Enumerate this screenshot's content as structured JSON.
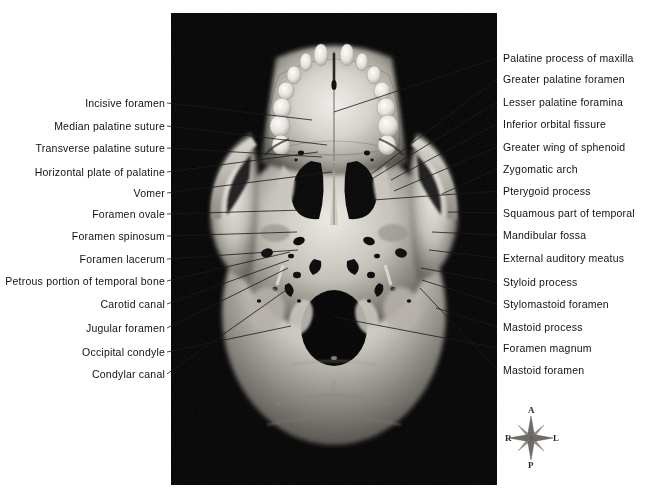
{
  "figure": {
    "photo": {
      "description": "black-and-white photograph of a human skull viewed from below",
      "frame": {
        "x": 171,
        "y": 13,
        "width": 326,
        "height": 472
      },
      "background_color": "#010101"
    },
    "page_background": "#ffffff",
    "label_color": "#111111",
    "leader_color": "#1a1a1a"
  },
  "labels_left": [
    {
      "text": "Incisive foramen",
      "x": 171,
      "y": 103,
      "tx": 312,
      "ty": 120
    },
    {
      "text": "Median palatine suture",
      "x": 171,
      "y": 126,
      "tx": 327,
      "ty": 145
    },
    {
      "text": "Transverse palatine suture",
      "x": 171,
      "y": 148,
      "tx": 322,
      "ty": 157
    },
    {
      "text": "Horizontal plate of palatine",
      "x": 171,
      "y": 172,
      "tx": 318,
      "ty": 152
    },
    {
      "text": "Vomer",
      "x": 171,
      "y": 193,
      "tx": 332,
      "ty": 172
    },
    {
      "text": "Foramen ovale",
      "x": 171,
      "y": 214,
      "tx": 304,
      "ty": 210
    },
    {
      "text": "Foramen spinosum",
      "x": 171,
      "y": 236,
      "tx": 297,
      "ty": 232
    },
    {
      "text": "Foramen lacerum",
      "x": 171,
      "y": 259,
      "tx": 298,
      "ty": 250
    },
    {
      "text": "Petrous portion of temporal bone",
      "x": 171,
      "y": 281,
      "tx": 290,
      "ty": 252
    },
    {
      "text": "Carotid canal",
      "x": 171,
      "y": 304,
      "tx": 289,
      "ty": 260
    },
    {
      "text": "Jugular foramen",
      "x": 171,
      "y": 328,
      "tx": 288,
      "ty": 268
    },
    {
      "text": "Occipital condyle",
      "x": 171,
      "y": 352,
      "tx": 291,
      "ty": 326
    },
    {
      "text": "Condylar canal",
      "x": 171,
      "y": 374,
      "tx": 289,
      "ty": 288
    }
  ],
  "labels_right": [
    {
      "text": "Palatine process of maxilla",
      "x": 503,
      "y": 58,
      "tx": 334,
      "ty": 112
    },
    {
      "text": "Greater palatine foramen",
      "x": 503,
      "y": 79,
      "tx": 366,
      "ty": 178
    },
    {
      "text": "Lesser palatine foramina",
      "x": 503,
      "y": 102,
      "tx": 367,
      "ty": 182
    },
    {
      "text": "Inferior orbital fissure",
      "x": 503,
      "y": 124,
      "tx": 391,
      "ty": 180
    },
    {
      "text": "Greater wing of sphenoid",
      "x": 503,
      "y": 147,
      "tx": 394,
      "ty": 191
    },
    {
      "text": "Zygomatic arch",
      "x": 503,
      "y": 169,
      "tx": 442,
      "ty": 194
    },
    {
      "text": "Pterygoid process",
      "x": 503,
      "y": 191,
      "tx": 373,
      "ty": 200
    },
    {
      "text": "Squamous part of temporal",
      "x": 503,
      "y": 213,
      "tx": 448,
      "ty": 212
    },
    {
      "text": "Mandibular fossa",
      "x": 503,
      "y": 235,
      "tx": 432,
      "ty": 232
    },
    {
      "text": "External auditory meatus",
      "x": 503,
      "y": 258,
      "tx": 429,
      "ty": 250
    },
    {
      "text": "Styloid process",
      "x": 503,
      "y": 282,
      "tx": 421,
      "ty": 268
    },
    {
      "text": "Stylomastoid foramen",
      "x": 503,
      "y": 304,
      "tx": 422,
      "ty": 280
    },
    {
      "text": "Mastoid process",
      "x": 503,
      "y": 327,
      "tx": 436,
      "ty": 308
    },
    {
      "text": "Foramen magnum",
      "x": 503,
      "y": 348,
      "tx": 334,
      "ty": 317
    },
    {
      "text": "Mastoid foramen",
      "x": 503,
      "y": 370,
      "tx": 420,
      "ty": 288
    }
  ],
  "compass": {
    "anterior": "A",
    "posterior": "P",
    "right": "R",
    "left": "L",
    "center": {
      "x": 531,
      "y": 438
    }
  }
}
